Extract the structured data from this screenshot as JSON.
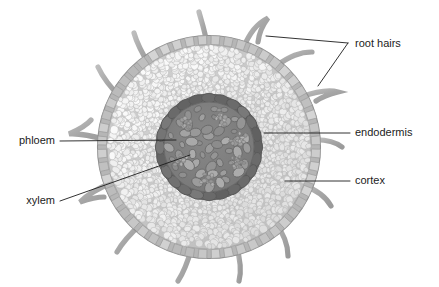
{
  "diagram": {
    "type": "botanical-cross-section",
    "background_color": "#ffffff",
    "center": {
      "x": 209,
      "y": 147
    },
    "labels": [
      {
        "id": "root-hairs",
        "text": "root hairs",
        "text_x": 355,
        "text_y": 44,
        "anchor": "start"
      },
      {
        "id": "endodermis",
        "text": "endodermis",
        "text_x": 355,
        "text_y": 133,
        "anchor": "start"
      },
      {
        "id": "cortex",
        "text": "cortex",
        "text_x": 355,
        "text_y": 181,
        "anchor": "start"
      },
      {
        "id": "phloem",
        "text": "phloem",
        "text_x": 55,
        "text_y": 141,
        "anchor": "end"
      },
      {
        "id": "xylem",
        "text": "xylem",
        "text_x": 55,
        "text_y": 201,
        "anchor": "end"
      }
    ],
    "structures": [
      {
        "id": "root-hair-appendages",
        "name": "root hairs",
        "count": 12,
        "color": "#a9a9a9"
      },
      {
        "id": "epidermis-ring",
        "name": "epidermis",
        "color": "#b0b0b0",
        "outer_radius": 112
      },
      {
        "id": "cortex-region",
        "name": "cortex",
        "color": "#c9c9c9",
        "outer_radius": 103
      },
      {
        "id": "endodermis-ring",
        "name": "endodermis",
        "color": "#6f6f6f",
        "outer_radius": 54
      },
      {
        "id": "stele-core",
        "name": "vascular cylinder",
        "color": "#7d7d7d",
        "outer_radius": 46
      },
      {
        "id": "xylem-vessels",
        "name": "xylem",
        "color": "#8c8c8c"
      },
      {
        "id": "phloem-clusters",
        "name": "phloem",
        "color": "#9a9a9a"
      }
    ],
    "colors": {
      "outline": "#8f8f8f",
      "epidermis": "#b4b4b4",
      "cortex_fill": "#cbcbcb",
      "cortex_cell": "#e4e4e4",
      "endodermis": "#707070",
      "stele": "#7d7d7d",
      "xylem": "#949494",
      "phloem": "#a3a3a3",
      "hair": "#aaaaaa",
      "label_text": "#1c1c1c",
      "leader_line": "#1c1c1c"
    }
  }
}
